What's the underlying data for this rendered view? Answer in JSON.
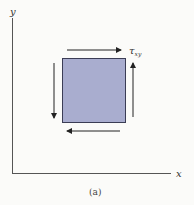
{
  "diagram": {
    "axes": {
      "x_label": "x",
      "y_label": "y"
    },
    "element": {
      "fill": "#a9adcf",
      "stroke": "#3b3d55"
    },
    "shear_label": {
      "symbol": "τ",
      "subscript": "xy"
    },
    "arrows": [
      "top-right",
      "right-up",
      "bottom-left",
      "left-down"
    ],
    "caption": "(a)",
    "colors": {
      "axis": "#555555",
      "arrow": "#222222"
    }
  }
}
